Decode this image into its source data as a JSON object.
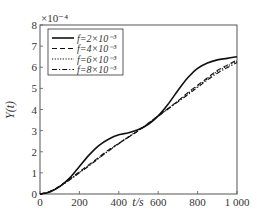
{
  "chart_data": {
    "type": "line",
    "title": "",
    "xlabel": "t/s",
    "ylabel": "Y(t)",
    "y_multiplier": "×10⁻⁴",
    "xlim": [
      0,
      1000
    ],
    "ylim": [
      0,
      8
    ],
    "xticks": [
      "0",
      "200",
      "400",
      "600",
      "800",
      "1 000"
    ],
    "yticks": [
      "0",
      "1",
      "2",
      "3",
      "4",
      "5",
      "6",
      "7",
      "8"
    ],
    "grid": false,
    "legend_position": "upper left",
    "x": [
      0,
      50,
      100,
      150,
      200,
      250,
      300,
      350,
      400,
      450,
      500,
      550,
      600,
      650,
      700,
      750,
      800,
      850,
      900,
      950,
      1000
    ],
    "series": [
      {
        "name": "f=2×10⁻³",
        "style": "solid",
        "values": [
          0,
          0.1,
          0.35,
          0.75,
          1.3,
          1.85,
          2.3,
          2.6,
          2.8,
          2.9,
          3.05,
          3.3,
          3.7,
          4.25,
          4.9,
          5.5,
          5.95,
          6.2,
          6.35,
          6.42,
          6.5
        ]
      },
      {
        "name": "f=4×10⁻³",
        "style": "dashed",
        "values": [
          0,
          0.12,
          0.38,
          0.7,
          1.05,
          1.4,
          1.75,
          2.1,
          2.4,
          2.7,
          3.0,
          3.35,
          3.7,
          4.05,
          4.4,
          4.8,
          5.15,
          5.5,
          5.85,
          6.1,
          6.35
        ]
      },
      {
        "name": "f=6×10⁻³",
        "style": "dotted",
        "values": [
          0,
          0.12,
          0.37,
          0.68,
          1.02,
          1.36,
          1.72,
          2.07,
          2.4,
          2.72,
          3.02,
          3.35,
          3.7,
          4.05,
          4.4,
          4.75,
          5.1,
          5.45,
          5.8,
          6.05,
          6.3
        ]
      },
      {
        "name": "f=8×10⁻³",
        "style": "dashdot",
        "values": [
          0,
          0.11,
          0.36,
          0.66,
          1.0,
          1.34,
          1.7,
          2.05,
          2.38,
          2.7,
          3.0,
          3.33,
          3.68,
          4.02,
          4.36,
          4.7,
          5.05,
          5.4,
          5.72,
          5.98,
          6.22
        ]
      }
    ]
  }
}
